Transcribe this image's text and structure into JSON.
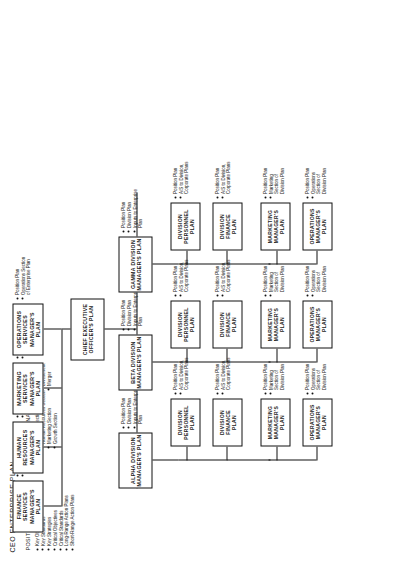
{
  "chart_data": {
    "type": "diagram",
    "title": "CEO ENTERPRISE PLAN",
    "orientation": "rotated-90-ccw"
  },
  "header": {
    "title": "CEO ENTERPRISE PLAN",
    "col_position": {
      "heading": "POSITION PLAN",
      "items": [
        "Key Objective",
        "Key Standards",
        "Key Strategies",
        "Critical Objectives",
        "Critical Standards",
        "Long-Range Action Plans",
        "Short-Range Action Plans"
      ]
    },
    "col_functional": {
      "heading": "FUNCTIONAL PLANS",
      "items": [
        "Financial Section",
        "Human Resources Section",
        "Marketing Section",
        "Growth Section"
      ],
      "subitems": [
        "Acquisition",
        "Divestment",
        "Merger"
      ]
    }
  },
  "ceo": {
    "title": "CHIEF EXECUTIVE\nOFFICER'S PLAN"
  },
  "functional_managers": [
    {
      "title": "FINANCE SERVICES\nMANAGER'S PLAN",
      "bullets": [
        "Position Plan",
        "Financial Section\nof Enterprise Plan"
      ]
    },
    {
      "title": "HUMAN RESOURCES\nMANAGER'S PLAN",
      "bullets": [
        "Position Plan",
        "Human Resources\nSection of\nEnterprise Plan"
      ]
    },
    {
      "title": "MARKETING\nSERVICES\nMANAGER'S PLAN",
      "bullets": [
        "Position Plan",
        "Marketing Section\nof Enterprise Plan"
      ]
    },
    {
      "title": "OPERATIONS\nSERVICES\nMANAGER'S PLAN",
      "bullets": [
        "Position Plan",
        "Operations Section\nof Enterprise Plan"
      ]
    }
  ],
  "divisions": [
    {
      "title": "ALPHA DIVISION\nMANAGER'S PLAN",
      "bullets": [
        "Position Plan",
        "Division Plan",
        "Inputs to Enterprise\nPlan"
      ]
    },
    {
      "title": "BETA DIVISION\nMANAGER'S PLAN",
      "bullets": [
        "Position Plan",
        "Division Plan",
        "Inputs to Enterprise\nPlan"
      ]
    },
    {
      "title": "GAMMA DIVISION\nMANAGER'S PLAN",
      "bullets": [
        "Position Plan",
        "Division Plan",
        "Inputs to Enterprise\nPlan"
      ]
    }
  ],
  "sub_plans": {
    "division_finance": {
      "title": "DIVISION\nFINANCE\nPLAN",
      "bullets": [
        "Position Plan",
        "A/S to Division,\nCorporate Plans"
      ]
    },
    "division_personnel": {
      "title": "DIVISION\nPERSONNEL\nPLAN",
      "bullets": [
        "Position Plan",
        "A/S to Division,\nCorporate Plans"
      ]
    },
    "operations_manager": {
      "title": "OPERATIONS\nMANAGER'S\nPLAN",
      "bullets": [
        "Position Plan",
        "Operations\nSection of\nDivision Plan"
      ]
    },
    "marketing_manager": {
      "title": "MARKETING\nMANAGER'S\nPLAN",
      "bullets": [
        "Position Plan",
        "Marketing\nSection of\nDivision Plan"
      ]
    }
  }
}
